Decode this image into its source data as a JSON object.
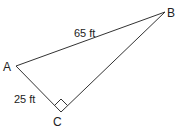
{
  "diagram": {
    "type": "right-triangle",
    "vertices": [
      {
        "label": "A",
        "x": 16,
        "y": 66
      },
      {
        "label": "B",
        "x": 165,
        "y": 12
      },
      {
        "label": "C",
        "x": 61,
        "y": 112
      }
    ],
    "sides": [
      {
        "from": "A",
        "to": "B",
        "length_label": "65 ft"
      },
      {
        "from": "A",
        "to": "C",
        "length_label": "25 ft"
      }
    ],
    "right_angle_at": "C",
    "line_color": "#333333"
  }
}
